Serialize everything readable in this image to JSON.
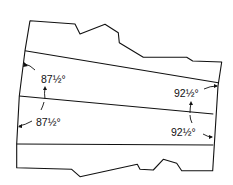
{
  "diagram": {
    "type": "technical-line-drawing",
    "labels": {
      "left_top": "87½°",
      "left_bottom": "87½°",
      "right_top": "92½°",
      "right_bottom": "92½°"
    },
    "colors": {
      "line": "#111111",
      "background": "#ffffff"
    }
  }
}
